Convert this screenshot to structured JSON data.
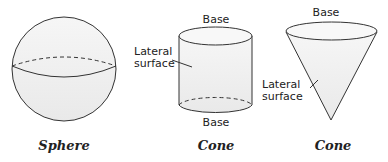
{
  "figure": {
    "shapes": [
      {
        "name": "Sphere",
        "caption": "Sphere",
        "labels": []
      },
      {
        "name": "Cylinder",
        "caption": "Cylinder",
        "labels": {
          "top": "Base",
          "bottom": "Base",
          "lateral_line1": "Lateral",
          "lateral_line2": "surface"
        }
      },
      {
        "name": "Cone",
        "caption": "Cone",
        "labels": {
          "top": "Base",
          "lateral_line1": "Lateral",
          "lateral_line2": "surface"
        }
      }
    ],
    "colors": {
      "fill": "#efefef",
      "stroke": "#333333"
    }
  }
}
